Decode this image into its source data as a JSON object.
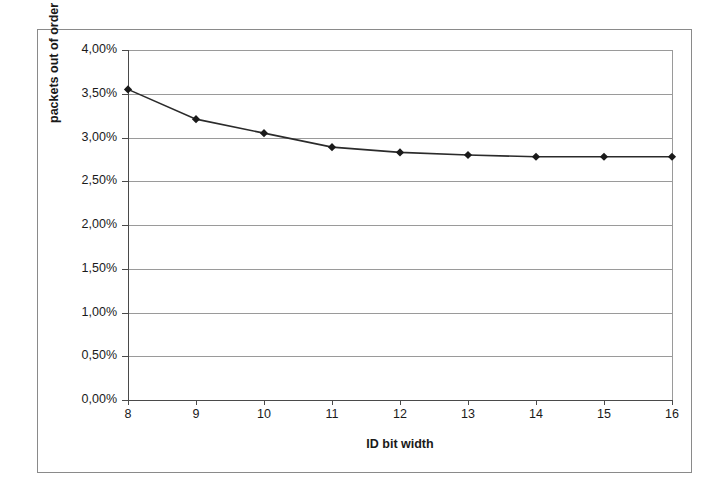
{
  "chart_data": {
    "type": "line",
    "title": "",
    "xlabel": "ID bit width",
    "ylabel": "packets out of order",
    "x": [
      8,
      9,
      10,
      11,
      12,
      13,
      14,
      15,
      16
    ],
    "categories": [
      "8",
      "9",
      "10",
      "11",
      "12",
      "13",
      "14",
      "15",
      "16"
    ],
    "values": [
      3.55,
      3.21,
      3.05,
      2.89,
      2.83,
      2.8,
      2.78,
      2.78,
      2.78
    ],
    "series": [
      {
        "name": "packets out of order",
        "values": [
          3.55,
          3.21,
          3.05,
          2.89,
          2.83,
          2.8,
          2.78,
          2.78,
          2.78
        ]
      }
    ],
    "xlim": [
      8,
      16
    ],
    "ylim": [
      0.0,
      4.0
    ],
    "ytick_values": [
      0.0,
      0.5,
      1.0,
      1.5,
      2.0,
      2.5,
      3.0,
      3.5,
      4.0
    ],
    "ytick_labels": [
      "0,00%",
      "0,50%",
      "1,00%",
      "1,50%",
      "2,00%",
      "2,50%",
      "3,00%",
      "3,50%",
      "4,00%"
    ],
    "xtick_labels": [
      "8",
      "9",
      "10",
      "11",
      "12",
      "13",
      "14",
      "15",
      "16"
    ],
    "grid": "horizontal",
    "legend": "none",
    "marker": "diamond",
    "line_color": "#2b2b2b",
    "marker_color": "#1a1a1a",
    "grid_color": "#9a9a9a",
    "axis_color": "#4a4a4a",
    "frame_color": "#8a8a8a",
    "background": "#ffffff",
    "decimal_separator": ","
  }
}
